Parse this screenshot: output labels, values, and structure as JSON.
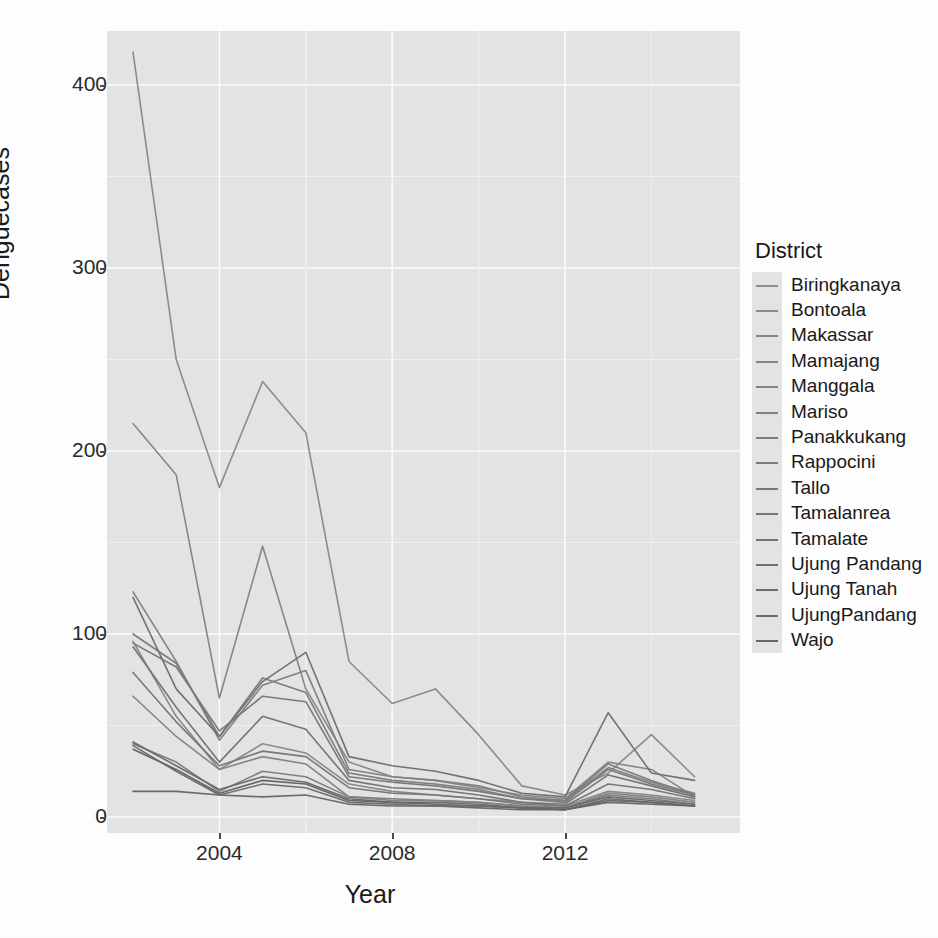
{
  "chart_data": {
    "type": "line",
    "title": "",
    "xlabel": "Year",
    "ylabel": "Denguecases",
    "legend_title": "District",
    "legend_position": "right",
    "grid": true,
    "xlim": [
      2002,
      2015
    ],
    "ylim": [
      0,
      430
    ],
    "x": [
      2002,
      2003,
      2004,
      2005,
      2006,
      2007,
      2008,
      2009,
      2010,
      2011,
      2012,
      2013,
      2014,
      2015
    ],
    "xticks": [
      2004,
      2008,
      2012
    ],
    "xtick_labels": [
      "2004",
      "2008",
      "2012"
    ],
    "yticks": [
      0,
      100,
      200,
      300,
      400
    ],
    "ytick_labels": [
      "0",
      "100",
      "200",
      "300",
      "400"
    ],
    "series": [
      {
        "name": "Biringkanaya",
        "color": "#8c8c8c",
        "values": [
          418,
          250,
          180,
          238,
          210,
          85,
          62,
          70,
          45,
          17,
          12,
          24,
          45,
          22
        ]
      },
      {
        "name": "Bontoala",
        "color": "#8a8a8a",
        "values": [
          96,
          55,
          26,
          40,
          35,
          18,
          14,
          12,
          10,
          8,
          6,
          14,
          12,
          9
        ]
      },
      {
        "name": "Makassar",
        "color": "#878787",
        "values": [
          215,
          187,
          65,
          148,
          70,
          30,
          22,
          20,
          16,
          12,
          10,
          30,
          26,
          11
        ]
      },
      {
        "name": "Mamajang",
        "color": "#858585",
        "values": [
          66,
          44,
          26,
          33,
          29,
          11,
          9,
          9,
          8,
          6,
          5,
          13,
          11,
          8
        ]
      },
      {
        "name": "Manggala",
        "color": "#828282",
        "values": [
          123,
          85,
          42,
          72,
          80,
          26,
          22,
          20,
          17,
          11,
          9,
          27,
          19,
          13
        ]
      },
      {
        "name": "Mariso",
        "color": "#808080",
        "values": [
          40,
          30,
          14,
          25,
          22,
          11,
          10,
          9,
          8,
          6,
          5,
          12,
          10,
          7
        ]
      },
      {
        "name": "Panakkukang",
        "color": "#7d7d7d",
        "values": [
          100,
          84,
          44,
          76,
          68,
          24,
          20,
          18,
          15,
          10,
          9,
          29,
          20,
          12
        ]
      },
      {
        "name": "Rappocini",
        "color": "#7a7a7a",
        "values": [
          95,
          82,
          47,
          66,
          63,
          22,
          19,
          17,
          14,
          10,
          8,
          26,
          18,
          12
        ]
      },
      {
        "name": "Tallo",
        "color": "#787878",
        "values": [
          79,
          52,
          28,
          36,
          33,
          16,
          13,
          12,
          10,
          7,
          6,
          18,
          15,
          10
        ]
      },
      {
        "name": "Tamalanrea",
        "color": "#757575",
        "values": [
          93,
          60,
          30,
          55,
          48,
          20,
          16,
          15,
          12,
          8,
          7,
          23,
          17,
          11
        ]
      },
      {
        "name": "Tamalate",
        "color": "#727272",
        "values": [
          120,
          70,
          44,
          74,
          90,
          33,
          28,
          25,
          20,
          13,
          11,
          57,
          24,
          20
        ]
      },
      {
        "name": "Ujung Pandang",
        "color": "#6f6f6f",
        "values": [
          39,
          25,
          12,
          18,
          16,
          8,
          7,
          6,
          6,
          5,
          4,
          10,
          8,
          6
        ]
      },
      {
        "name": "Ujung Tanah",
        "color": "#6c6c6c",
        "values": [
          41,
          28,
          15,
          22,
          19,
          10,
          8,
          8,
          7,
          5,
          5,
          11,
          9,
          7
        ]
      },
      {
        "name": "UjungPandang",
        "color": "#6a6a6a",
        "values": [
          14,
          14,
          12,
          11,
          12,
          7,
          6,
          6,
          5,
          4,
          4,
          8,
          7,
          6
        ]
      },
      {
        "name": "Wajo",
        "color": "#666666",
        "values": [
          37,
          26,
          13,
          20,
          18,
          9,
          8,
          7,
          6,
          5,
          4,
          9,
          8,
          6
        ]
      }
    ]
  },
  "colors": {
    "panel_background": "#e3e3e3",
    "gridline": "#fbfbfb",
    "axis_text": "#2b2b2b",
    "page_background": "#fdfdfd"
  }
}
